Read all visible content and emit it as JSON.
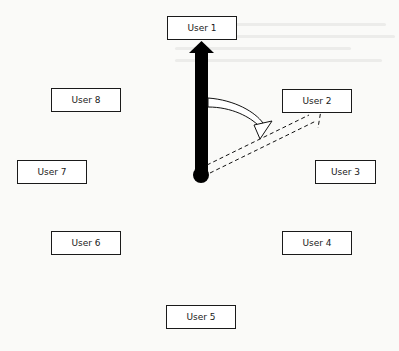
{
  "diagram": {
    "users": [
      {
        "id": "user-1",
        "label": "User 1",
        "x": 167,
        "y": 16,
        "w": 70
      },
      {
        "id": "user-2",
        "label": "User 2",
        "x": 282,
        "y": 89,
        "w": 70
      },
      {
        "id": "user-3",
        "label": "User 3",
        "x": 315,
        "y": 160,
        "w": 61
      },
      {
        "id": "user-4",
        "label": "User 4",
        "x": 282,
        "y": 231,
        "w": 70
      },
      {
        "id": "user-5",
        "label": "User 5",
        "x": 166,
        "y": 305,
        "w": 70
      },
      {
        "id": "user-6",
        "label": "User 6",
        "x": 51,
        "y": 231,
        "w": 70
      },
      {
        "id": "user-7",
        "label": "User 7",
        "x": 17,
        "y": 160,
        "w": 70
      },
      {
        "id": "user-8",
        "label": "User 8",
        "x": 51,
        "y": 88,
        "w": 70
      }
    ],
    "arrows": {
      "thick_arrow": {
        "from": "center",
        "to": "User 1",
        "style": "solid-thick",
        "color": "#000000"
      },
      "curved_arrow": {
        "from": "thick arrow shaft",
        "to": "dashed arrow",
        "style": "outline-curved"
      },
      "dashed_arrow": {
        "from": "center",
        "to": "User 2",
        "style": "dashed-outline"
      }
    },
    "center_node": {
      "x": 201,
      "y": 174
    }
  }
}
